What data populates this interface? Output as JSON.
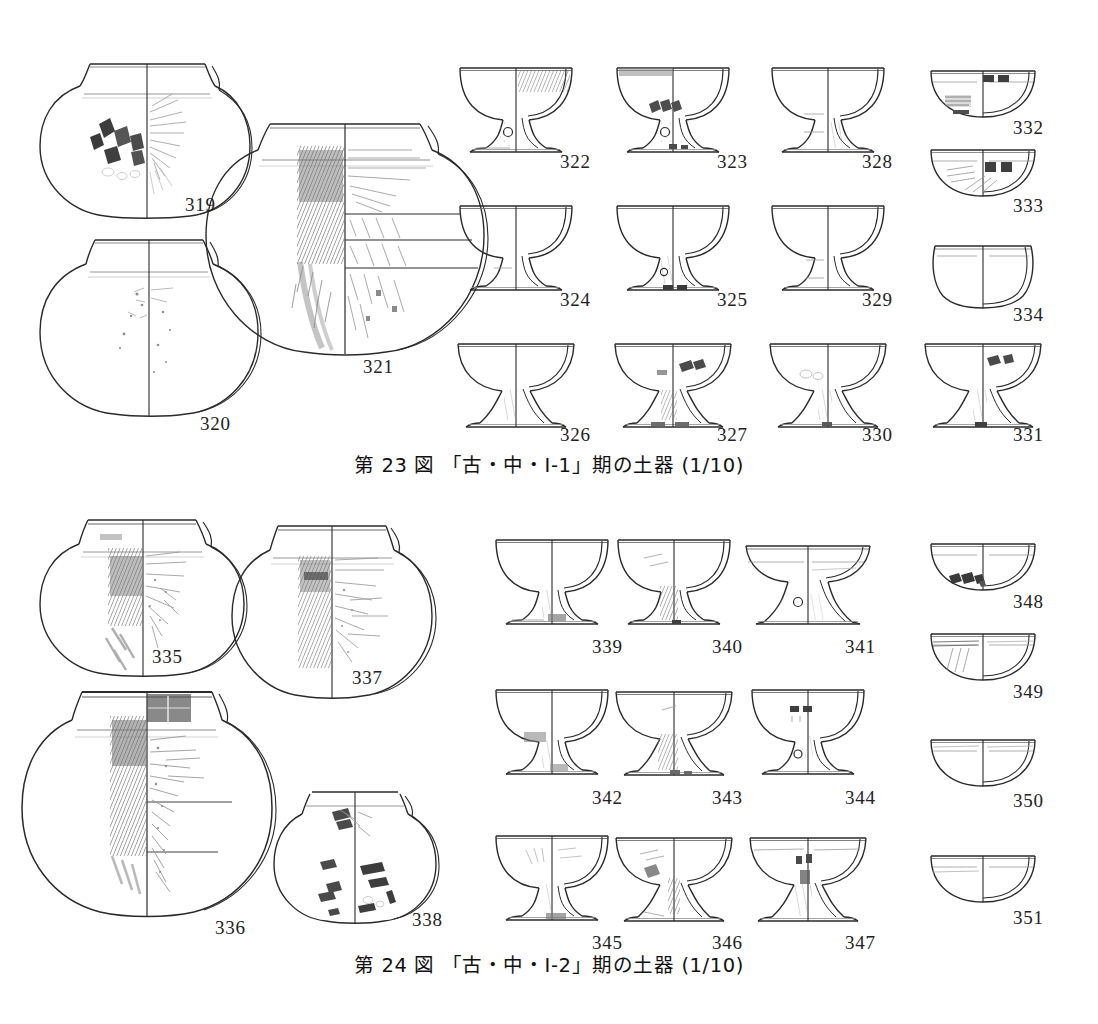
{
  "document": {
    "type": "archaeological-pottery-plate",
    "scale_note": "(1/10)"
  },
  "plates": [
    {
      "id": "plate-23",
      "caption": "第 23 図 「古・中・I-1」期の土器 (1/10)",
      "figure_number": "第 23 図",
      "period_label": "「古・中・I-1」期の土器",
      "scale": "(1/10)",
      "items": [
        {
          "num": "319",
          "kind": "globular-jar",
          "label_x": 185,
          "label_y": 195
        },
        {
          "num": "320",
          "kind": "globular-jar",
          "label_x": 200,
          "label_y": 414
        },
        {
          "num": "321",
          "kind": "large-globular-jar",
          "label_x": 363,
          "label_y": 357
        },
        {
          "num": "322",
          "kind": "pedestal-cup",
          "label_x": 560,
          "label_y": 152
        },
        {
          "num": "323",
          "kind": "pedestal-cup",
          "label_x": 717,
          "label_y": 152
        },
        {
          "num": "328",
          "kind": "pedestal-cup",
          "label_x": 862,
          "label_y": 152
        },
        {
          "num": "332",
          "kind": "shallow-bowl",
          "label_x": 1013,
          "label_y": 118
        },
        {
          "num": "333",
          "kind": "shallow-bowl",
          "label_x": 1013,
          "label_y": 196
        },
        {
          "num": "324",
          "kind": "pedestal-cup",
          "label_x": 560,
          "label_y": 290
        },
        {
          "num": "325",
          "kind": "pedestal-cup",
          "label_x": 717,
          "label_y": 290
        },
        {
          "num": "329",
          "kind": "pedestal-cup",
          "label_x": 862,
          "label_y": 290
        },
        {
          "num": "334",
          "kind": "small-cup",
          "label_x": 1013,
          "label_y": 305
        },
        {
          "num": "326",
          "kind": "pedestal-cup",
          "label_x": 560,
          "label_y": 425
        },
        {
          "num": "327",
          "kind": "pedestal-cup",
          "label_x": 717,
          "label_y": 425
        },
        {
          "num": "330",
          "kind": "pedestal-cup",
          "label_x": 862,
          "label_y": 425
        },
        {
          "num": "331",
          "kind": "pedestal-cup",
          "label_x": 1013,
          "label_y": 425
        }
      ]
    },
    {
      "id": "plate-24",
      "caption": "第 24 図 「古・中・I-2」期の土器 (1/10)",
      "figure_number": "第 24 図",
      "period_label": "「古・中・I-2」期の土器",
      "scale": "(1/10)",
      "items": [
        {
          "num": "335",
          "kind": "globular-jar",
          "label_x": 152,
          "label_y": 647
        },
        {
          "num": "337",
          "kind": "globular-jar",
          "label_x": 352,
          "label_y": 668
        },
        {
          "num": "336",
          "kind": "large-ovoid-jar",
          "label_x": 215,
          "label_y": 918
        },
        {
          "num": "338",
          "kind": "globular-jar",
          "label_x": 412,
          "label_y": 910
        },
        {
          "num": "339",
          "kind": "pedestal-cup",
          "label_x": 592,
          "label_y": 637
        },
        {
          "num": "340",
          "kind": "pedestal-cup",
          "label_x": 712,
          "label_y": 637
        },
        {
          "num": "341",
          "kind": "pedestal-cup",
          "label_x": 845,
          "label_y": 637
        },
        {
          "num": "348",
          "kind": "shallow-bowl",
          "label_x": 1013,
          "label_y": 592
        },
        {
          "num": "349",
          "kind": "shallow-bowl",
          "label_x": 1013,
          "label_y": 682
        },
        {
          "num": "342",
          "kind": "pedestal-cup",
          "label_x": 592,
          "label_y": 788
        },
        {
          "num": "343",
          "kind": "pedestal-cup",
          "label_x": 712,
          "label_y": 788
        },
        {
          "num": "344",
          "kind": "pedestal-cup",
          "label_x": 845,
          "label_y": 788
        },
        {
          "num": "350",
          "kind": "shallow-bowl",
          "label_x": 1013,
          "label_y": 791
        },
        {
          "num": "345",
          "kind": "pedestal-cup",
          "label_x": 592,
          "label_y": 933
        },
        {
          "num": "346",
          "kind": "pedestal-cup",
          "label_x": 712,
          "label_y": 933
        },
        {
          "num": "347",
          "kind": "pedestal-cup",
          "label_x": 845,
          "label_y": 933
        },
        {
          "num": "351",
          "kind": "shallow-bowl",
          "label_x": 1013,
          "label_y": 908
        }
      ]
    }
  ],
  "colors": {
    "ink": "#2a2a2a",
    "ink_light": "#7d7d7d",
    "shade": "#8d8d8d",
    "dark_patch": "#4a4a4a",
    "paper": "#ffffff"
  }
}
